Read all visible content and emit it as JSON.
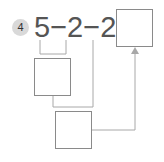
{
  "problem": {
    "number": "4",
    "expression": "5−2−2=",
    "answer_box_value": "",
    "step1_box_value": "",
    "step2_box_value": ""
  },
  "colors": {
    "line": "#a8a8a8",
    "box_border": "#8a8a8a",
    "badge": "#d9d9d9"
  }
}
